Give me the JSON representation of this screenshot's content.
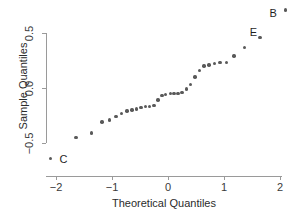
{
  "chart_data": {
    "type": "scatter",
    "title": "",
    "xlabel": "Theoretical Quantiles",
    "ylabel": "Sample Quantiles",
    "xlim": [
      -2.18,
      2.18
    ],
    "ylim": [
      -0.8,
      0.78
    ],
    "xticks": [
      -2,
      -1,
      0,
      1,
      2
    ],
    "xtick_labels": [
      "−2",
      "−1",
      "0",
      "1",
      "2"
    ],
    "yticks": [
      0.5,
      0.0,
      -0.5
    ],
    "ytick_labels": [
      "0.5",
      "0.0",
      "−0.5"
    ],
    "grid": false,
    "legend": false,
    "point_color": "#595959",
    "axis_color": "#9a9a9a",
    "series": [
      {
        "name": "qq-points",
        "x": [
          -2.1,
          -1.64,
          -1.37,
          -1.18,
          -1.05,
          -0.93,
          -0.83,
          -0.73,
          -0.64,
          -0.56,
          -0.48,
          -0.4,
          -0.33,
          -0.25,
          -0.18,
          -0.11,
          -0.04,
          0.04,
          0.11,
          0.18,
          0.25,
          0.33,
          0.4,
          0.48,
          0.56,
          0.64,
          0.73,
          0.83,
          0.93,
          1.05,
          1.18,
          1.37,
          1.64,
          2.1
        ],
        "y": [
          -0.64,
          -0.45,
          -0.41,
          -0.31,
          -0.29,
          -0.26,
          -0.23,
          -0.21,
          -0.2,
          -0.19,
          -0.18,
          -0.17,
          -0.17,
          -0.16,
          -0.11,
          -0.07,
          -0.06,
          -0.05,
          -0.05,
          -0.05,
          -0.04,
          -0.01,
          0.03,
          0.1,
          0.16,
          0.2,
          0.21,
          0.22,
          0.23,
          0.23,
          0.29,
          0.37,
          0.46,
          0.71
        ]
      }
    ],
    "annotations": [
      {
        "label": "C",
        "x": -2.1,
        "y": -0.64,
        "dx": 9,
        "dy": -4
      },
      {
        "label": "E",
        "x": 1.64,
        "y": 0.46,
        "dx": -10,
        "dy": -10
      },
      {
        "label": "B",
        "x": 2.1,
        "y": 0.71,
        "dx": -16,
        "dy": -2
      }
    ]
  },
  "axes": {
    "x_title": "Theoretical Quantiles",
    "y_title": "Sample Quantiles"
  }
}
